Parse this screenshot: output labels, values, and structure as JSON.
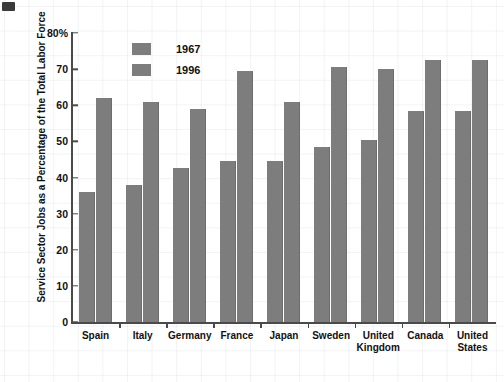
{
  "decor": {
    "corner_mark_name": "corner-mark"
  },
  "chart_data": {
    "type": "bar",
    "title": "",
    "xlabel": "",
    "ylabel": "Service Sector Jobs as a Percentage of the Total Labor Force",
    "ylim": [
      0,
      80
    ],
    "yticks": [
      0,
      10,
      20,
      30,
      40,
      50,
      60,
      70,
      80
    ],
    "ytick_labels": [
      "0",
      "10",
      "20",
      "30",
      "40",
      "50",
      "60",
      "70",
      "80%"
    ],
    "grid": false,
    "legend_position": "top-left-inside",
    "categories": [
      "Spain",
      "Italy",
      "Germany",
      "France",
      "Japan",
      "Sweden",
      "United Kingdom",
      "Canada",
      "United States"
    ],
    "series": [
      {
        "name": "1967",
        "color": "#7d7d7d",
        "values": [
          36,
          38,
          42.5,
          44.5,
          44.5,
          48.5,
          50.5,
          58.5,
          58.5
        ]
      },
      {
        "name": "1996",
        "color": "#7d7d7d",
        "values": [
          62,
          61,
          59,
          69.5,
          61,
          70.5,
          70,
          72.5,
          72.5
        ]
      }
    ]
  },
  "legend": {
    "items": [
      {
        "label": "1967",
        "color": "#7d7d7d"
      },
      {
        "label": "1996",
        "color": "#7d7d7d"
      }
    ]
  }
}
